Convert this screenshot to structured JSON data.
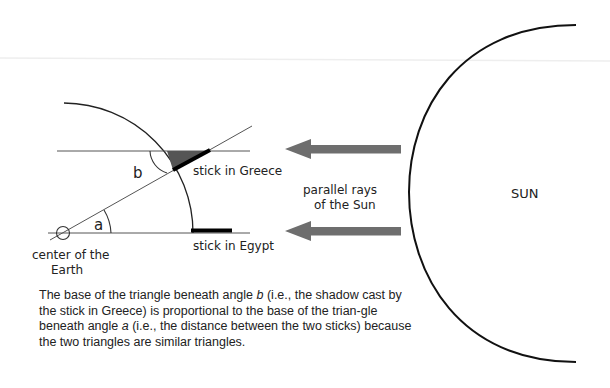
{
  "diagram": {
    "labels": {
      "angle_a": "a",
      "angle_b": "b",
      "stick_greece": "stick in Greece",
      "stick_egypt": "stick in Egypt",
      "center_line1": "center of the",
      "center_line2": "Earth",
      "rays_line1": "parallel rays",
      "rays_line2": "of the Sun",
      "sun": "SUN"
    },
    "colors": {
      "line": "#555555",
      "arc": "#222222",
      "arrow": "#6e6e6e",
      "shadow": "#555555",
      "stick": "#000000"
    },
    "caption": {
      "part1": "The base of the triangle beneath angle ",
      "var_b": "b",
      "part2": " (i.e., the shadow cast by the stick in Greece) is proportional to the base of the trian-gle beneath angle ",
      "var_a": "a",
      "part3": " (i.e., the distance between the two sticks) because the two triangles are similar triangles."
    }
  }
}
